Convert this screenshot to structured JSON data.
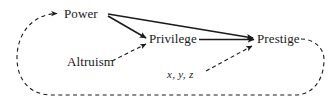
{
  "diagram": {
    "type": "causal-path-diagram",
    "background_color": "#ffffff",
    "stroke_color": "#1a1a1a",
    "nodes": [
      {
        "id": "power",
        "label": "Power"
      },
      {
        "id": "privilege",
        "label": "Privilege"
      },
      {
        "id": "prestige",
        "label": "Prestige"
      },
      {
        "id": "altruism",
        "label": "Altruism"
      }
    ],
    "annotations": [
      {
        "id": "xyz",
        "label": "x, y, z",
        "style": "italic"
      }
    ],
    "edges": [
      {
        "from": "power",
        "to": "privilege",
        "style": "solid",
        "arrow": "single"
      },
      {
        "from": "power",
        "to": "prestige",
        "style": "solid",
        "arrow": "single"
      },
      {
        "from": "privilege",
        "to": "prestige",
        "style": "solid",
        "arrow": "single"
      },
      {
        "from": "altruism",
        "to": "privilege",
        "style": "dashed",
        "arrow": "single"
      },
      {
        "from": "xyz",
        "to": "prestige",
        "style": "dashed",
        "arrow": "single"
      },
      {
        "from": "prestige",
        "to": "power",
        "style": "dashed",
        "arrow": "single",
        "shape": "feedback-loop"
      }
    ]
  }
}
